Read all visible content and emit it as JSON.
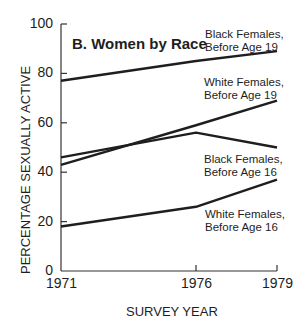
{
  "chart_data": {
    "type": "line",
    "title": "B.  Women by Race",
    "xlabel": "SURVEY YEAR",
    "ylabel": "PERCENTAGE SEXUALLY ACTIVE",
    "x": [
      1971,
      1976,
      1979
    ],
    "x_tick_labels": [
      "1971",
      "1976",
      "1979"
    ],
    "y_tick_labels": [
      "0",
      "20",
      "40",
      "60",
      "80",
      "100"
    ],
    "ylim": [
      0,
      100
    ],
    "grid": false,
    "legend_position": "inline labels at right",
    "series": [
      {
        "name": "Black Females, Before Age 19",
        "label_lines": [
          "Black Females,",
          "Before Age 19"
        ],
        "values": [
          77,
          85,
          89
        ]
      },
      {
        "name": "White Females, Before Age 19",
        "label_lines": [
          "White Females,",
          "Before Age 19"
        ],
        "values": [
          43,
          59,
          69
        ]
      },
      {
        "name": "Black Females, Before Age 16",
        "label_lines": [
          "Black Females,",
          "Before Age 16"
        ],
        "values": [
          46,
          56,
          50
        ]
      },
      {
        "name": "White Females, Before Age 16",
        "label_lines": [
          "White Females,",
          "Before Age 16"
        ],
        "values": [
          18,
          26,
          37
        ]
      }
    ],
    "line_color": "#1e1e1e"
  }
}
